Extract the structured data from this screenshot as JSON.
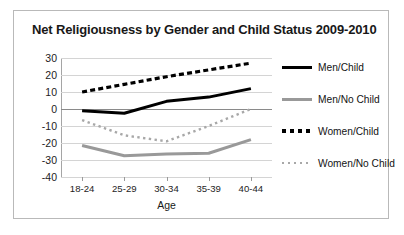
{
  "chart_data": {
    "type": "line",
    "title": "Net Religiousness by Gender and Child Status 2009-2010",
    "xlabel": "Age",
    "ylabel": "",
    "categories": [
      "18-24",
      "25-29",
      "30-34",
      "35-39",
      "40-44"
    ],
    "ylim": [
      -40,
      30
    ],
    "ytick_step": 10,
    "yticks": [
      30,
      20,
      10,
      0,
      -10,
      -20,
      -30,
      -40
    ],
    "grid": true,
    "legend_position": "right",
    "series": [
      {
        "name": "Men/Child",
        "values": [
          -1,
          -2.5,
          4.5,
          7,
          12
        ],
        "color": "#000000",
        "style": "solid",
        "width": 3
      },
      {
        "name": "Men/No Child",
        "values": [
          -21.5,
          -27.5,
          -26.5,
          -26,
          -18
        ],
        "color": "#999999",
        "style": "solid",
        "width": 3
      },
      {
        "name": "Women/Child",
        "values": [
          10,
          14.5,
          19,
          23,
          27
        ],
        "color": "#000000",
        "style": "dashed",
        "width": 3.2
      },
      {
        "name": "Women/No Child",
        "values": [
          -6.5,
          -15.5,
          -19,
          -10,
          0
        ],
        "color": "#a8a8a8",
        "style": "dotted",
        "width": 2.4
      }
    ]
  },
  "legend": {
    "items": [
      {
        "label": "Men/Child",
        "swatch": "sw-solid-black"
      },
      {
        "label": "Men/No Child",
        "swatch": "sw-solid-gray"
      },
      {
        "label": "Women/Child",
        "swatch": "sw-dash-black"
      },
      {
        "label": "Women/No Child",
        "swatch": "sw-dot-gray"
      }
    ]
  },
  "colors": {
    "frame_border": "#b9b9b9",
    "gridline": "#d4d4d4",
    "zero_line": "#8a8a8a",
    "axis": "#a5a5a5",
    "text": "#181818"
  }
}
